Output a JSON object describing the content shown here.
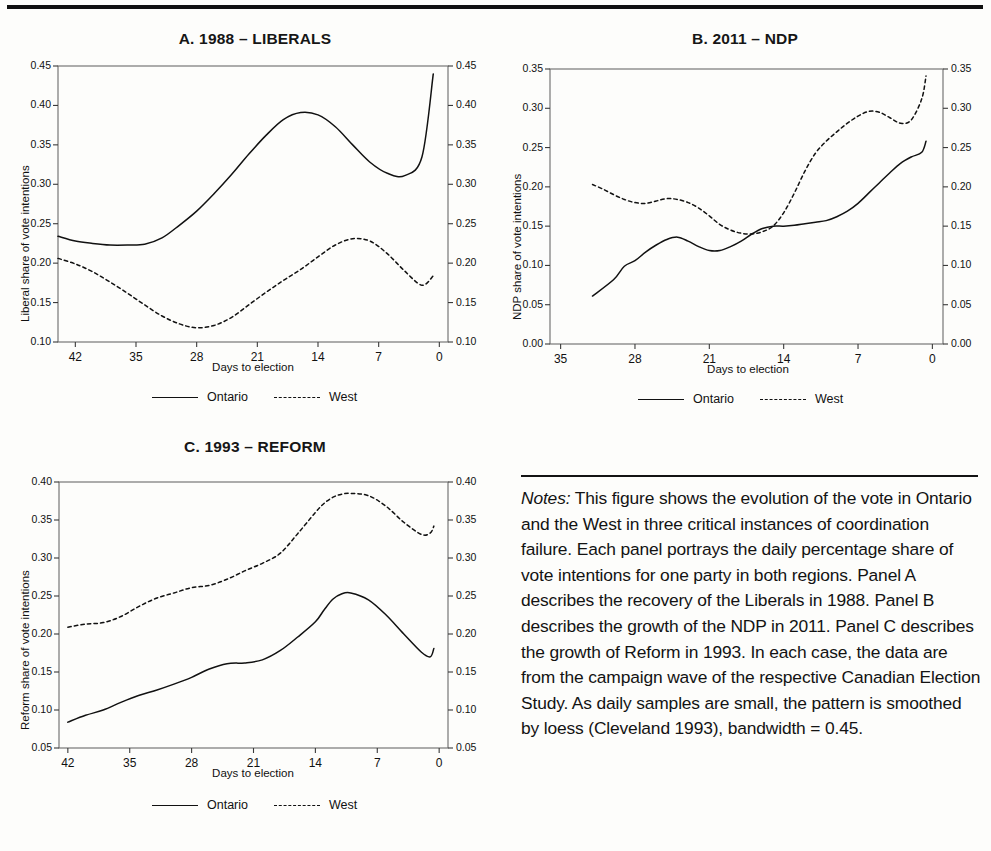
{
  "figure": {
    "notes_label": "Notes:",
    "notes_text": " This figure shows the evolution of the vote in Ontario and the West in three critical instances of coordination failure. Each panel portrays the daily percentage share of vote intentions for one party in both regions. Panel A describes the recovery of the Liberals in 1988. Panel B describes the growth of the NDP in 2011. Panel C describes the growth of Reform in 1993. In each case, the data are from the campaign wave of the respective Canadian Election Study. As daily samples are small, the pattern is smoothed by loess (Cleveland 1993), bandwidth = 0.45."
  },
  "legend": {
    "ontario": "Ontario",
    "west": "West"
  },
  "chart_data": [
    {
      "id": "panel-a",
      "type": "line",
      "title": "A.  1988 – LIBERALS",
      "xlabel": "Days to election",
      "ylabel": "Liberal share of vote intentions",
      "xlim": [
        44,
        -1
      ],
      "ylim": [
        0.1,
        0.45
      ],
      "xticks": [
        42,
        35,
        28,
        21,
        14,
        7,
        0
      ],
      "xtick_labels": [
        "42",
        "35",
        "28",
        "21",
        "14",
        "7",
        "0"
      ],
      "yticks": [
        0.1,
        0.15,
        0.2,
        0.25,
        0.3,
        0.35,
        0.4,
        0.45
      ],
      "ytick_labels": [
        "0.10",
        "0.15",
        "0.20",
        "0.25",
        "0.30",
        "0.35",
        "0.40",
        "0.45"
      ],
      "grid": false,
      "legend_position": "below",
      "series": [
        {
          "name": "Ontario",
          "style": "solid",
          "x": [
            44,
            42,
            40,
            38,
            36,
            34,
            32,
            30,
            28,
            26,
            24,
            22,
            20,
            18,
            16,
            14,
            12,
            10,
            8,
            6,
            4,
            2,
            0.7
          ],
          "values": [
            0.234,
            0.228,
            0.225,
            0.223,
            0.223,
            0.224,
            0.232,
            0.248,
            0.266,
            0.288,
            0.312,
            0.338,
            0.362,
            0.382,
            0.391,
            0.388,
            0.373,
            0.35,
            0.328,
            0.314,
            0.311,
            0.335,
            0.44
          ]
        },
        {
          "name": "West",
          "style": "dashed",
          "x": [
            44,
            42,
            40,
            38,
            36,
            34,
            32,
            30,
            28,
            26,
            24,
            22,
            20,
            18,
            16,
            14,
            12,
            10,
            8,
            6,
            4,
            2,
            0.7
          ],
          "values": [
            0.206,
            0.199,
            0.189,
            0.176,
            0.162,
            0.147,
            0.133,
            0.123,
            0.118,
            0.121,
            0.131,
            0.147,
            0.163,
            0.178,
            0.192,
            0.208,
            0.223,
            0.231,
            0.228,
            0.212,
            0.19,
            0.172,
            0.184
          ]
        }
      ]
    },
    {
      "id": "panel-b",
      "type": "line",
      "title": "B.  2011 – NDP",
      "xlabel": "Days to election",
      "ylabel": "NDP share of vote intentions",
      "xlim": [
        36,
        -1
      ],
      "ylim": [
        0.0,
        0.35
      ],
      "xticks": [
        35,
        28,
        21,
        14,
        7,
        0
      ],
      "xtick_labels": [
        "35",
        "28",
        "21",
        "14",
        "7",
        "0"
      ],
      "yticks": [
        0.0,
        0.05,
        0.1,
        0.15,
        0.2,
        0.25,
        0.3,
        0.35
      ],
      "ytick_labels": [
        "0.00",
        "0.05",
        "0.10",
        "0.15",
        "0.20",
        "0.25",
        "0.30",
        "0.35"
      ],
      "grid": false,
      "legend_position": "below",
      "series": [
        {
          "name": "Ontario",
          "style": "solid",
          "x": [
            32,
            30,
            29,
            28,
            27,
            26,
            25,
            24,
            23,
            22,
            21,
            20,
            19,
            18,
            17,
            16,
            15,
            14,
            13,
            12,
            11,
            10,
            9,
            8,
            7,
            6,
            5,
            4,
            3,
            2,
            1,
            0.6
          ],
          "values": [
            0.061,
            0.082,
            0.099,
            0.106,
            0.117,
            0.126,
            0.133,
            0.136,
            0.131,
            0.124,
            0.119,
            0.119,
            0.124,
            0.131,
            0.14,
            0.147,
            0.15,
            0.15,
            0.151,
            0.153,
            0.155,
            0.157,
            0.162,
            0.169,
            0.179,
            0.192,
            0.205,
            0.218,
            0.23,
            0.238,
            0.244,
            0.258
          ]
        },
        {
          "name": "West",
          "style": "dashed",
          "x": [
            32,
            31,
            30,
            29,
            28,
            27,
            26,
            25,
            24,
            23,
            22,
            21,
            20,
            19,
            18,
            17,
            16,
            15,
            14,
            13,
            12,
            11,
            10,
            9,
            8,
            7,
            6,
            5,
            4,
            3,
            2,
            1,
            0.6
          ],
          "values": [
            0.203,
            0.197,
            0.19,
            0.184,
            0.18,
            0.179,
            0.182,
            0.185,
            0.184,
            0.18,
            0.173,
            0.163,
            0.152,
            0.145,
            0.141,
            0.14,
            0.143,
            0.15,
            0.167,
            0.192,
            0.22,
            0.243,
            0.258,
            0.27,
            0.281,
            0.29,
            0.296,
            0.295,
            0.288,
            0.281,
            0.285,
            0.312,
            0.341
          ]
        }
      ]
    },
    {
      "id": "panel-c",
      "type": "line",
      "title": "C.  1993 – REFORM",
      "xlabel": "Days to election",
      "ylabel": "Reform share of vote intentions",
      "xlim": [
        43,
        -1
      ],
      "ylim": [
        0.05,
        0.4
      ],
      "xticks": [
        42,
        35,
        28,
        21,
        14,
        7,
        0
      ],
      "xtick_labels": [
        "42",
        "35",
        "28",
        "21",
        "14",
        "7",
        "0"
      ],
      "yticks": [
        0.05,
        0.1,
        0.15,
        0.2,
        0.25,
        0.3,
        0.35,
        0.4
      ],
      "ytick_labels": [
        "0.05",
        "0.10",
        "0.15",
        "0.20",
        "0.25",
        "0.30",
        "0.35",
        "0.40"
      ],
      "grid": false,
      "legend_position": "below",
      "series": [
        {
          "name": "Ontario",
          "style": "solid",
          "x": [
            42,
            40,
            38,
            36,
            34,
            32,
            30,
            28,
            26,
            24,
            22,
            20,
            18,
            16,
            14,
            13,
            12,
            11,
            10,
            8,
            6,
            4,
            2,
            1,
            0.6
          ],
          "values": [
            0.084,
            0.093,
            0.1,
            0.11,
            0.119,
            0.126,
            0.134,
            0.143,
            0.154,
            0.161,
            0.162,
            0.166,
            0.178,
            0.196,
            0.216,
            0.232,
            0.246,
            0.253,
            0.254,
            0.245,
            0.225,
            0.2,
            0.176,
            0.17,
            0.181
          ]
        },
        {
          "name": "West",
          "style": "dashed",
          "x": [
            42,
            40,
            38,
            36,
            34,
            32,
            30,
            28,
            26,
            24,
            22,
            20,
            18,
            16,
            14,
            13,
            12,
            11,
            10,
            8,
            6,
            4,
            2,
            1,
            0.6
          ],
          "values": [
            0.209,
            0.213,
            0.215,
            0.223,
            0.236,
            0.247,
            0.254,
            0.261,
            0.264,
            0.272,
            0.283,
            0.293,
            0.306,
            0.332,
            0.36,
            0.372,
            0.38,
            0.384,
            0.385,
            0.382,
            0.368,
            0.347,
            0.331,
            0.333,
            0.342
          ]
        }
      ]
    }
  ]
}
